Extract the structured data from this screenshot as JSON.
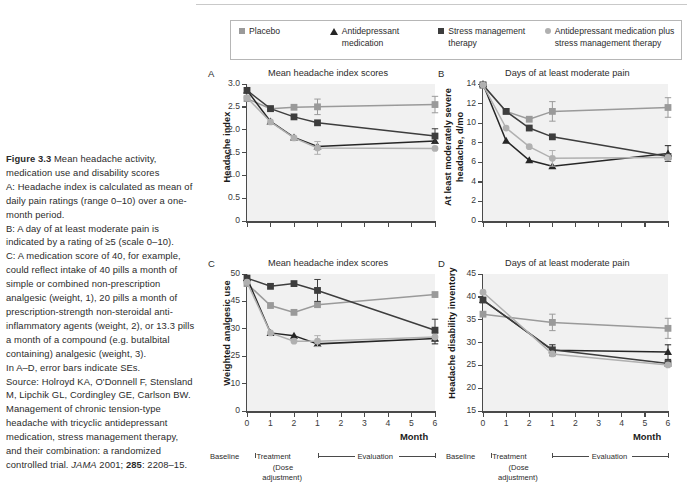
{
  "caption": {
    "figure_label": "Figure 3.3",
    "title": "Mean headache activity, medication use and disability scores",
    "lines": [
      "A: Headache index is calculated as mean of daily pain ratings (range 0–10) over a one-month period.",
      "B: A day of at least moderate pain is indicated by a rating of ≥5 (scale 0–10).",
      "C: A medication score of 40, for example, could reflect intake of 40 pills a month of simple or combined non-prescription analgesic (weight, 1), 20 pills a month of prescription-strength non-steroidal anti-inflammatory agents (weight, 2), or 13.3 pills a month of a compound (e.g. butalbital containing) analgesic (weight, 3).",
      "In A–D, error bars indicate SEs."
    ],
    "source_prefix": "Source: ",
    "source_text": "Holroyd KA, O'Donnell F, Stensland M, Lipchik GL, Cordingley GE, Carlson BW. Management of chronic tension-type headache with tricyclic antidepressant medication, stress management therapy, and their combination: a randomized controlled trial. ",
    "journal": "JAMA",
    "journal_rest": " 2001; ",
    "volume": "285",
    "pages": ": 2208–15."
  },
  "legend": {
    "items": [
      {
        "label": "Placebo",
        "marker": "square-marker",
        "color": "#9a9a9a"
      },
      {
        "label": "Antidepressant medication",
        "marker": "triangle-marker",
        "color": "#262626"
      },
      {
        "label": "Stress management therapy",
        "marker": "square-marker",
        "color": "#3d3d3d"
      },
      {
        "label": "Antidepressant medication plus stress management therapy",
        "marker": "circle-marker",
        "color": "#b0b0b0"
      }
    ]
  },
  "axis": {
    "xlabel": "Month",
    "xticks": [
      "0",
      "1",
      "2",
      "1",
      "2",
      "3",
      "4",
      "5",
      "6"
    ],
    "phase": {
      "baseline": "Baseline",
      "treatment": "Treatment",
      "dose_line1": "(Dose",
      "dose_line2": "adjustment)",
      "evaluation": "Evaluation"
    }
  },
  "chart_data": [
    {
      "panel": "A",
      "type": "line",
      "title": "Mean headache index scores",
      "xlabel": "Month",
      "ylabel": "Headache index",
      "x": [
        0,
        1,
        2,
        3,
        4,
        5,
        6,
        7,
        8
      ],
      "xtick_labels_visible": false,
      "yticks": [
        0,
        0.5,
        1.0,
        1.5,
        2.0,
        2.5,
        3.0
      ],
      "ytick_labels": [
        "0",
        "0.5",
        "1.0",
        "1.5",
        "2.0",
        "2.5",
        "3.0"
      ],
      "ylim": [
        0,
        3.0
      ],
      "grid": false,
      "series": [
        {
          "name": "Placebo",
          "marker": "square-marker",
          "color": "#9a9a9a",
          "points": [
            {
              "x": 0,
              "y": 2.68
            },
            {
              "x": 1,
              "y": 2.46
            },
            {
              "x": 2,
              "y": 2.49
            },
            {
              "x": 3,
              "y": 2.5
            },
            {
              "x": 8,
              "y": 2.55
            }
          ],
          "errors": [
            {
              "x": 0,
              "e": 0.0
            },
            {
              "x": 1,
              "e": 0.0
            },
            {
              "x": 2,
              "e": 0.0
            },
            {
              "x": 3,
              "e": 0.17
            },
            {
              "x": 8,
              "e": 0.18
            }
          ]
        },
        {
          "name": "Antidepressant medication",
          "marker": "triangle-marker",
          "color": "#262626",
          "points": [
            {
              "x": 0,
              "y": 2.86
            },
            {
              "x": 1,
              "y": 2.18
            },
            {
              "x": 2,
              "y": 1.83
            },
            {
              "x": 3,
              "y": 1.63
            },
            {
              "x": 8,
              "y": 1.75
            }
          ],
          "errors": [
            {
              "x": 0,
              "e": 0.0
            },
            {
              "x": 1,
              "e": 0.0
            },
            {
              "x": 2,
              "e": 0.0
            },
            {
              "x": 3,
              "e": 0.0
            },
            {
              "x": 8,
              "e": 0.0
            }
          ]
        },
        {
          "name": "Stress management therapy",
          "marker": "square-marker",
          "color": "#3d3d3d",
          "points": [
            {
              "x": 0,
              "y": 2.86
            },
            {
              "x": 1,
              "y": 2.46
            },
            {
              "x": 2,
              "y": 2.28
            },
            {
              "x": 3,
              "y": 2.15
            },
            {
              "x": 8,
              "y": 1.86
            }
          ],
          "errors": [
            {
              "x": 0,
              "e": 0.0
            },
            {
              "x": 1,
              "e": 0.0
            },
            {
              "x": 2,
              "e": 0.0
            },
            {
              "x": 3,
              "e": 0.0
            },
            {
              "x": 8,
              "e": 0.16
            }
          ]
        },
        {
          "name": "Antidepressant medication plus stress management therapy",
          "marker": "circle-marker",
          "color": "#b0b0b0",
          "points": [
            {
              "x": 0,
              "y": 2.7
            },
            {
              "x": 1,
              "y": 2.17
            },
            {
              "x": 2,
              "y": 1.82
            },
            {
              "x": 3,
              "y": 1.6
            },
            {
              "x": 8,
              "y": 1.59
            }
          ],
          "errors": [
            {
              "x": 0,
              "e": 0.0
            },
            {
              "x": 1,
              "e": 0.0
            },
            {
              "x": 2,
              "e": 0.0
            },
            {
              "x": 3,
              "e": 0.14
            },
            {
              "x": 8,
              "e": 0.0
            }
          ]
        }
      ]
    },
    {
      "panel": "B",
      "type": "line",
      "title": "Days of at least moderate pain",
      "xlabel": "Month",
      "ylabel": "At least moderately severe headache, d/mo",
      "x": [
        0,
        1,
        2,
        3,
        4,
        5,
        6,
        7,
        8
      ],
      "xtick_labels_visible": false,
      "yticks": [
        0,
        2,
        4,
        6,
        8,
        10,
        12,
        14
      ],
      "ytick_labels": [
        "0",
        "2",
        "4",
        "6",
        "8",
        "10",
        "12",
        "14"
      ],
      "ylim": [
        0,
        14
      ],
      "grid": false,
      "series": [
        {
          "name": "Placebo",
          "marker": "square-marker",
          "color": "#9a9a9a",
          "points": [
            {
              "x": 0,
              "y": 13.9
            },
            {
              "x": 1,
              "y": 11.2
            },
            {
              "x": 2,
              "y": 10.4
            },
            {
              "x": 3,
              "y": 11.2
            },
            {
              "x": 8,
              "y": 11.6
            }
          ],
          "errors": [
            {
              "x": 0,
              "e": 0.0
            },
            {
              "x": 1,
              "e": 0.0
            },
            {
              "x": 2,
              "e": 0.0
            },
            {
              "x": 3,
              "e": 1.0
            },
            {
              "x": 8,
              "e": 1.0
            }
          ]
        },
        {
          "name": "Antidepressant medication",
          "marker": "triangle-marker",
          "color": "#262626",
          "points": [
            {
              "x": 0,
              "y": 14.0
            },
            {
              "x": 1,
              "y": 8.2
            },
            {
              "x": 2,
              "y": 6.2
            },
            {
              "x": 3,
              "y": 5.6
            },
            {
              "x": 8,
              "y": 6.9
            }
          ],
          "errors": [
            {
              "x": 0,
              "e": 0.0
            },
            {
              "x": 1,
              "e": 0.0
            },
            {
              "x": 2,
              "e": 0.0
            },
            {
              "x": 3,
              "e": 0.0
            },
            {
              "x": 8,
              "e": 0.8
            }
          ]
        },
        {
          "name": "Stress management therapy",
          "marker": "square-marker",
          "color": "#3d3d3d",
          "points": [
            {
              "x": 0,
              "y": 13.9
            },
            {
              "x": 1,
              "y": 11.2
            },
            {
              "x": 2,
              "y": 9.5
            },
            {
              "x": 3,
              "y": 8.6
            },
            {
              "x": 8,
              "y": 6.6
            }
          ],
          "errors": [
            {
              "x": 0,
              "e": 0.0
            },
            {
              "x": 1,
              "e": 0.0
            },
            {
              "x": 2,
              "e": 0.0
            },
            {
              "x": 3,
              "e": 0.0
            },
            {
              "x": 8,
              "e": 0.0
            }
          ]
        },
        {
          "name": "Antidepressant medication plus stress management therapy",
          "marker": "circle-marker",
          "color": "#b0b0b0",
          "points": [
            {
              "x": 0,
              "y": 13.9
            },
            {
              "x": 1,
              "y": 9.5
            },
            {
              "x": 2,
              "y": 7.6
            },
            {
              "x": 3,
              "y": 6.4
            },
            {
              "x": 8,
              "y": 6.5
            }
          ],
          "errors": [
            {
              "x": 0,
              "e": 0.0
            },
            {
              "x": 1,
              "e": 0.0
            },
            {
              "x": 2,
              "e": 0.0
            },
            {
              "x": 3,
              "e": 0.8
            },
            {
              "x": 8,
              "e": 0.0
            }
          ]
        }
      ]
    },
    {
      "panel": "C",
      "type": "line",
      "title": "Mean headache index scores",
      "xlabel": "Month",
      "ylabel": "Weighted analgesic use",
      "x": [
        0,
        1,
        2,
        3,
        4,
        5,
        6,
        7,
        8
      ],
      "xtick_labels_visible": true,
      "yticks": [
        0,
        10,
        20,
        30,
        40,
        50
      ],
      "ytick_labels": [
        "0",
        "10",
        "25",
        "30",
        "45",
        "50"
      ],
      "ylim": [
        0,
        50
      ],
      "grid": false,
      "series": [
        {
          "name": "Placebo",
          "marker": "square-marker",
          "color": "#9a9a9a",
          "points": [
            {
              "x": 0,
              "y": 46.5
            },
            {
              "x": 1,
              "y": 38.5
            },
            {
              "x": 2,
              "y": 36.0
            },
            {
              "x": 3,
              "y": 38.8
            },
            {
              "x": 8,
              "y": 42.5
            }
          ],
          "errors": [
            {
              "x": 0,
              "e": 0.0
            },
            {
              "x": 1,
              "e": 0.0
            },
            {
              "x": 2,
              "e": 0.0
            },
            {
              "x": 3,
              "e": 0.0
            },
            {
              "x": 8,
              "e": 0.0
            }
          ]
        },
        {
          "name": "Antidepressant medication",
          "marker": "triangle-marker",
          "color": "#262626",
          "points": [
            {
              "x": 0,
              "y": 48.5
            },
            {
              "x": 1,
              "y": 28.5
            },
            {
              "x": 2,
              "y": 27.5
            },
            {
              "x": 3,
              "y": 24.5
            },
            {
              "x": 8,
              "y": 26.5
            }
          ],
          "errors": [
            {
              "x": 0,
              "e": 0.0
            },
            {
              "x": 1,
              "e": 0.0
            },
            {
              "x": 2,
              "e": 0.0
            },
            {
              "x": 3,
              "e": 0.0
            },
            {
              "x": 8,
              "e": 2.0
            }
          ]
        },
        {
          "name": "Stress management therapy",
          "marker": "square-marker",
          "color": "#3d3d3d",
          "points": [
            {
              "x": 0,
              "y": 48.5
            },
            {
              "x": 1,
              "y": 45.5
            },
            {
              "x": 2,
              "y": 46.5
            },
            {
              "x": 3,
              "y": 44.0
            },
            {
              "x": 8,
              "y": 29.5
            }
          ],
          "errors": [
            {
              "x": 0,
              "e": 0.0
            },
            {
              "x": 1,
              "e": 0.0
            },
            {
              "x": 2,
              "e": 0.0
            },
            {
              "x": 3,
              "e": 4.0
            },
            {
              "x": 8,
              "e": 4.0
            }
          ]
        },
        {
          "name": "Antidepressant medication plus stress management therapy",
          "marker": "circle-marker",
          "color": "#b0b0b0",
          "points": [
            {
              "x": 0,
              "y": 47.0
            },
            {
              "x": 1,
              "y": 28.5
            },
            {
              "x": 2,
              "y": 25.5
            },
            {
              "x": 3,
              "y": 25.5
            },
            {
              "x": 8,
              "y": 27.0
            }
          ],
          "errors": [
            {
              "x": 0,
              "e": 0.0
            },
            {
              "x": 1,
              "e": 0.0
            },
            {
              "x": 2,
              "e": 0.0
            },
            {
              "x": 3,
              "e": 2.0
            },
            {
              "x": 8,
              "e": 0.0
            }
          ]
        }
      ]
    },
    {
      "panel": "D",
      "type": "line",
      "title": "Days of at least moderate pain",
      "xlabel": "Month",
      "ylabel": "Headache disability inventory",
      "x": [
        0,
        1,
        2,
        3,
        4,
        5,
        6,
        7,
        8
      ],
      "xtick_labels_visible": true,
      "yticks": [
        15,
        20,
        25,
        30,
        35,
        40,
        45
      ],
      "ytick_labels": [
        "15",
        "20",
        "25",
        "30",
        "35",
        "40",
        "45"
      ],
      "ylim": [
        15,
        45
      ],
      "grid": false,
      "series": [
        {
          "name": "Placebo",
          "marker": "square-marker",
          "color": "#9a9a9a",
          "points": [
            {
              "x": 0,
              "y": 36.2
            },
            {
              "x": 3,
              "y": 34.4
            },
            {
              "x": 8,
              "y": 33.1
            }
          ],
          "errors": [
            {
              "x": 0,
              "e": 0.0
            },
            {
              "x": 3,
              "e": 1.8
            },
            {
              "x": 8,
              "e": 2.2
            }
          ]
        },
        {
          "name": "Antidepressant medication",
          "marker": "triangle-marker",
          "color": "#262626",
          "points": [
            {
              "x": 0,
              "y": 39.3
            },
            {
              "x": 3,
              "y": 28.3
            },
            {
              "x": 8,
              "y": 27.9
            }
          ],
          "errors": [
            {
              "x": 0,
              "e": 0.0
            },
            {
              "x": 3,
              "e": 1.2
            },
            {
              "x": 8,
              "e": 1.6
            }
          ]
        },
        {
          "name": "Stress management therapy",
          "marker": "square-marker",
          "color": "#3d3d3d",
          "points": [
            {
              "x": 0,
              "y": 39.3
            },
            {
              "x": 3,
              "y": 28.4
            },
            {
              "x": 8,
              "y": 25.4
            }
          ],
          "errors": [
            {
              "x": 0,
              "e": 0.0
            },
            {
              "x": 3,
              "e": 0.0
            },
            {
              "x": 8,
              "e": 0.0
            }
          ]
        },
        {
          "name": "Antidepressant medication plus stress management therapy",
          "marker": "circle-marker",
          "color": "#b0b0b0",
          "points": [
            {
              "x": 0,
              "y": 41.0
            },
            {
              "x": 3,
              "y": 27.5
            },
            {
              "x": 8,
              "y": 25.1
            }
          ],
          "errors": [
            {
              "x": 0,
              "e": 0.0
            },
            {
              "x": 3,
              "e": 0.0
            },
            {
              "x": 8,
              "e": 0.0
            }
          ]
        }
      ]
    }
  ]
}
